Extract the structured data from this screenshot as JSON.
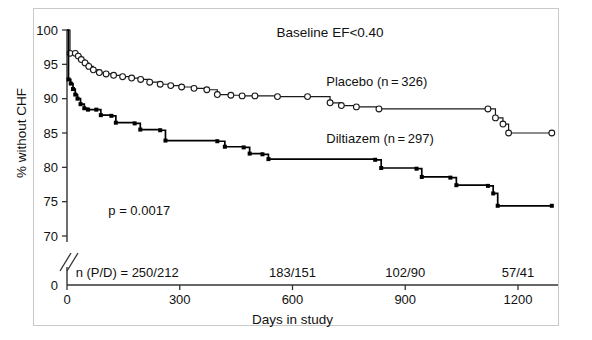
{
  "figure": {
    "title": "Baseline EF<0.40",
    "pvalue": "p = 0.0017",
    "xlabel": "Days in study",
    "ylabel": "% without CHF",
    "legend_placebo": "Placebo (n = 326)",
    "legend_diltiazem": "Diltiazem (n = 297)",
    "axis_break_note": "y-axis break between 70 and 0"
  },
  "risk_table": {
    "label": "n (P/D) = 250/212",
    "entries": [
      {
        "x": 0,
        "text": "n (P/D) = 250/212"
      },
      {
        "x": 600,
        "text": "183/151"
      },
      {
        "x": 900,
        "text": "102/90"
      },
      {
        "x": 1200,
        "text": "57/41"
      }
    ]
  },
  "axis": {
    "y_ticks": [
      100,
      95,
      90,
      85,
      80,
      75,
      70
    ],
    "y_zero_tick": 0,
    "y_tick_labels": [
      "100",
      "95",
      "90",
      "85",
      "80",
      "75",
      "70",
      "0"
    ],
    "x_ticks": [
      0,
      300,
      600,
      900,
      1200
    ],
    "x_tick_labels": [
      "0",
      "300",
      "600",
      "900",
      "1200"
    ]
  },
  "chart_data": {
    "type": "line",
    "subtype": "kaplan-meier step",
    "title": "Baseline EF<0.40",
    "xlabel": "Days in study",
    "ylabel": "% without CHF",
    "xlim": [
      0,
      1290
    ],
    "ylim": [
      70,
      100
    ],
    "y_break": {
      "from": 70,
      "to": 0
    },
    "grid": false,
    "legend_position": "inline-right",
    "annotations": [
      {
        "text": "p = 0.0017",
        "x": 110,
        "y": 73.2
      },
      {
        "text": "Placebo (n = 326)",
        "x": 690,
        "y": 91.6
      },
      {
        "text": "Diltiazem (n = 297)",
        "x": 690,
        "y": 83.5
      },
      {
        "text": "Baseline EF<0.40",
        "x": 700,
        "y": 99.2
      }
    ],
    "series": [
      {
        "name": "Placebo",
        "n": 326,
        "marker": "open-circle",
        "color": "#1a1a1a",
        "points": [
          {
            "x": 0,
            "y": 100.0
          },
          {
            "x": 8,
            "y": 96.6
          },
          {
            "x": 22,
            "y": 96.6
          },
          {
            "x": 30,
            "y": 96.2
          },
          {
            "x": 38,
            "y": 95.7
          },
          {
            "x": 48,
            "y": 95.2
          },
          {
            "x": 58,
            "y": 94.7
          },
          {
            "x": 70,
            "y": 94.2
          },
          {
            "x": 86,
            "y": 93.8
          },
          {
            "x": 104,
            "y": 93.6
          },
          {
            "x": 124,
            "y": 93.4
          },
          {
            "x": 148,
            "y": 93.2
          },
          {
            "x": 172,
            "y": 93.0
          },
          {
            "x": 196,
            "y": 92.8
          },
          {
            "x": 220,
            "y": 92.4
          },
          {
            "x": 248,
            "y": 92.1
          },
          {
            "x": 276,
            "y": 91.9
          },
          {
            "x": 305,
            "y": 91.7
          },
          {
            "x": 338,
            "y": 91.5
          },
          {
            "x": 372,
            "y": 91.3
          },
          {
            "x": 400,
            "y": 90.6
          },
          {
            "x": 436,
            "y": 90.5
          },
          {
            "x": 466,
            "y": 90.4
          },
          {
            "x": 500,
            "y": 90.4
          },
          {
            "x": 560,
            "y": 90.3
          },
          {
            "x": 640,
            "y": 90.3
          },
          {
            "x": 700,
            "y": 89.4
          },
          {
            "x": 730,
            "y": 89.0
          },
          {
            "x": 770,
            "y": 88.8
          },
          {
            "x": 830,
            "y": 88.5
          },
          {
            "x": 1120,
            "y": 88.5
          },
          {
            "x": 1140,
            "y": 87.2
          },
          {
            "x": 1160,
            "y": 86.3
          },
          {
            "x": 1175,
            "y": 85.0
          },
          {
            "x": 1290,
            "y": 85.0
          }
        ]
      },
      {
        "name": "Diltiazem",
        "n": 297,
        "marker": "filled-square",
        "color": "#000000",
        "points": [
          {
            "x": 0,
            "y": 100.0
          },
          {
            "x": 4,
            "y": 92.8
          },
          {
            "x": 10,
            "y": 92.2
          },
          {
            "x": 16,
            "y": 91.4
          },
          {
            "x": 22,
            "y": 90.6
          },
          {
            "x": 28,
            "y": 90.0
          },
          {
            "x": 36,
            "y": 89.2
          },
          {
            "x": 46,
            "y": 88.6
          },
          {
            "x": 56,
            "y": 88.4
          },
          {
            "x": 78,
            "y": 88.4
          },
          {
            "x": 90,
            "y": 87.6
          },
          {
            "x": 118,
            "y": 87.5
          },
          {
            "x": 130,
            "y": 86.5
          },
          {
            "x": 180,
            "y": 86.4
          },
          {
            "x": 195,
            "y": 85.5
          },
          {
            "x": 248,
            "y": 85.4
          },
          {
            "x": 262,
            "y": 83.9
          },
          {
            "x": 400,
            "y": 83.8
          },
          {
            "x": 420,
            "y": 83.0
          },
          {
            "x": 470,
            "y": 82.9
          },
          {
            "x": 486,
            "y": 82.0
          },
          {
            "x": 520,
            "y": 81.9
          },
          {
            "x": 536,
            "y": 81.2
          },
          {
            "x": 820,
            "y": 81.1
          },
          {
            "x": 836,
            "y": 79.9
          },
          {
            "x": 930,
            "y": 79.8
          },
          {
            "x": 944,
            "y": 78.6
          },
          {
            "x": 1020,
            "y": 78.5
          },
          {
            "x": 1036,
            "y": 77.4
          },
          {
            "x": 1120,
            "y": 77.3
          },
          {
            "x": 1134,
            "y": 76.2
          },
          {
            "x": 1146,
            "y": 74.4
          },
          {
            "x": 1290,
            "y": 74.4
          }
        ]
      }
    ]
  }
}
